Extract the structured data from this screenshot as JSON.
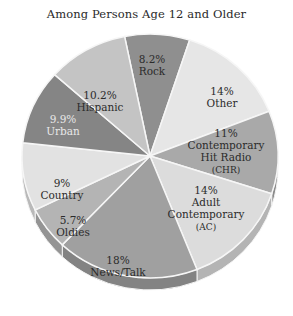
{
  "chart_data": {
    "type": "pie",
    "title": "Among Persons Age 12 and Older",
    "categories": [
      "Rock",
      "Other",
      "Contemporary Hit Radio (CHR)",
      "Adult Contemporary (AC)",
      "News/Talk",
      "Oldies",
      "Country",
      "Urban",
      "Hispanic"
    ],
    "values": [
      8.2,
      14,
      11,
      14,
      18,
      5.7,
      9,
      9.9,
      10.2
    ],
    "unit": "%",
    "labels": [
      {
        "pct": "8.2%",
        "lines": [
          "Rock"
        ]
      },
      {
        "pct": "14%",
        "lines": [
          "Other"
        ]
      },
      {
        "pct": "11%",
        "lines": [
          "Contemporary",
          "Hit Radio",
          "(CHR)"
        ]
      },
      {
        "pct": "14%",
        "lines": [
          "Adult",
          "Contemporary",
          "(AC)"
        ]
      },
      {
        "pct": "18%",
        "lines": [
          "News/Talk"
        ]
      },
      {
        "pct": "5.7%",
        "lines": [
          "Oldies"
        ]
      },
      {
        "pct": "9%",
        "lines": [
          "Country"
        ]
      },
      {
        "pct": "9.9%",
        "lines": [
          "Urban"
        ]
      },
      {
        "pct": "10.2%",
        "lines": [
          "Hispanic"
        ]
      }
    ],
    "colors": [
      "#8f8f8f",
      "#e6e6e6",
      "#a9a9a9",
      "#dcdcdc",
      "#a0a0a0",
      "#b4b4b4",
      "#e2e2e2",
      "#858585",
      "#c4c4c4"
    ],
    "legend": "none (labels on slices)",
    "style": "3D tilted pie, grayscale"
  },
  "header": {
    "title": "Among Persons Age 12 and Older"
  }
}
